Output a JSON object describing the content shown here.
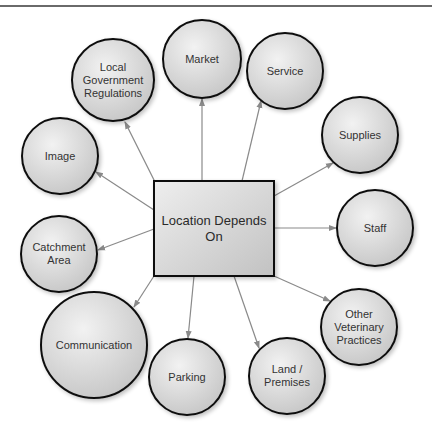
{
  "diagram": {
    "center": {
      "label": "Location Depends\nOn",
      "x": 154,
      "y": 181,
      "w": 120,
      "h": 95
    },
    "nodes": [
      {
        "id": "local-government-regulations",
        "label": "Local\nGovernment\nRegulations",
        "cx": 113,
        "cy": 80,
        "r": 41
      },
      {
        "id": "market",
        "label": "Market",
        "cx": 202,
        "cy": 59,
        "r": 39
      },
      {
        "id": "service",
        "label": "Service",
        "cx": 285,
        "cy": 71,
        "r": 38
      },
      {
        "id": "supplies",
        "label": "Supplies",
        "cx": 360,
        "cy": 135,
        "r": 38
      },
      {
        "id": "staff",
        "label": "Staff",
        "cx": 375,
        "cy": 228,
        "r": 38
      },
      {
        "id": "other-veterinary-practices",
        "label": "Other\nVeterinary\nPractices",
        "cx": 359,
        "cy": 327,
        "r": 38
      },
      {
        "id": "land-premises",
        "label": "Land /\nPremises",
        "cx": 287,
        "cy": 376,
        "r": 38
      },
      {
        "id": "parking",
        "label": "Parking",
        "cx": 187,
        "cy": 377,
        "r": 38
      },
      {
        "id": "communication",
        "label": "Communication",
        "cx": 94,
        "cy": 345,
        "r": 53
      },
      {
        "id": "catchment-area",
        "label": "Catchment\nArea",
        "cx": 59,
        "cy": 254,
        "r": 38
      },
      {
        "id": "image",
        "label": "Image",
        "cx": 60,
        "cy": 156,
        "r": 38
      }
    ],
    "arrows": [
      {
        "to": "local-government-regulations",
        "x1": 155,
        "y1": 182,
        "x2": 125,
        "y2": 122
      },
      {
        "to": "market",
        "x1": 202,
        "y1": 181,
        "x2": 202,
        "y2": 99
      },
      {
        "to": "service",
        "x1": 242,
        "y1": 181,
        "x2": 261,
        "y2": 101
      },
      {
        "to": "supplies",
        "x1": 274,
        "y1": 196,
        "x2": 333,
        "y2": 163
      },
      {
        "to": "staff",
        "x1": 274,
        "y1": 228,
        "x2": 336,
        "y2": 228
      },
      {
        "to": "other-veterinary-practices",
        "x1": 274,
        "y1": 276,
        "x2": 330,
        "y2": 301
      },
      {
        "to": "land-premises",
        "x1": 234,
        "y1": 276,
        "x2": 259,
        "y2": 348
      },
      {
        "to": "parking",
        "x1": 194,
        "y1": 276,
        "x2": 188,
        "y2": 338
      },
      {
        "to": "communication",
        "x1": 154,
        "y1": 276,
        "x2": 134,
        "y2": 307
      },
      {
        "to": "catchment-area",
        "x1": 154,
        "y1": 229,
        "x2": 98,
        "y2": 250
      },
      {
        "to": "image",
        "x1": 154,
        "y1": 210,
        "x2": 96,
        "y2": 172
      }
    ],
    "colors": {
      "node_fill_light": "#f0f0f0",
      "node_fill_dark": "#c8c8c8",
      "node_stroke": "#111111",
      "arrow": "#8a8a8a",
      "text": "#333333",
      "rule": "#6a6a6a"
    }
  }
}
